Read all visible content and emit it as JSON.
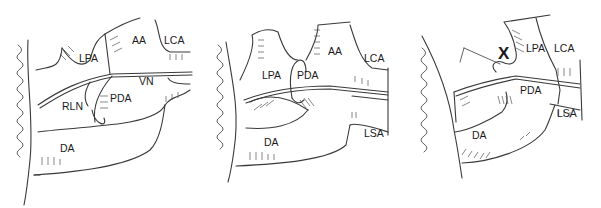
{
  "figure": {
    "panels": [
      {
        "id": "panel-1",
        "labels": {
          "aa": "AA",
          "lca": "LCA",
          "lpa": "LPA",
          "vn": "VN",
          "rln": "RLN",
          "pda": "PDA",
          "da": "DA"
        }
      },
      {
        "id": "panel-2",
        "labels": {
          "aa": "AA",
          "lca": "LCA",
          "lpa": "LPA",
          "pda": "PDA",
          "lsa": "LSA",
          "da": "DA"
        }
      },
      {
        "id": "panel-3",
        "labels": {
          "x": "X",
          "lpa": "LPA",
          "lca": "LCA",
          "pda": "PDA",
          "lsa": "LSA",
          "da": "DA"
        }
      }
    ]
  }
}
